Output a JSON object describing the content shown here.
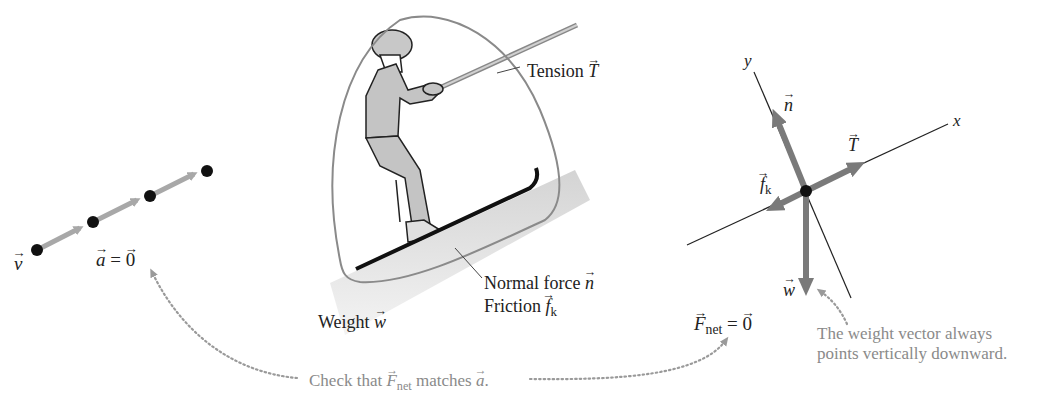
{
  "motion_diagram": {
    "velocity_label": "v",
    "acceleration_label": "a",
    "acceleration_equals": "= ",
    "acceleration_value": "0"
  },
  "pictorial": {
    "tension_label": "Tension ",
    "tension_symbol": "T",
    "normal_label": "Normal force ",
    "normal_symbol": "n",
    "friction_label": "Friction ",
    "friction_symbol": "f",
    "friction_sub": "k",
    "weight_label": "Weight ",
    "weight_symbol": "w"
  },
  "free_body": {
    "x_axis": "x",
    "y_axis": "y",
    "n": "n",
    "T": "T",
    "fk": "f",
    "fk_sub": "k",
    "w": "w",
    "fnet_symbol": "F",
    "fnet_sub": "net",
    "fnet_equals": " = ",
    "fnet_value": "0"
  },
  "notes": {
    "check_prefix": "Check that ",
    "check_symbol": "F",
    "check_sub": "net",
    "check_middle": " matches ",
    "check_accel": "a",
    "check_suffix": ".",
    "weight_note_line1": "The weight vector always",
    "weight_note_line2": "points vertically downward."
  },
  "colors": {
    "vector_gray": "#7a7a7a",
    "body_fill": "#c4c4c4",
    "note_gray": "#8a8a8a",
    "ink": "#222222"
  }
}
